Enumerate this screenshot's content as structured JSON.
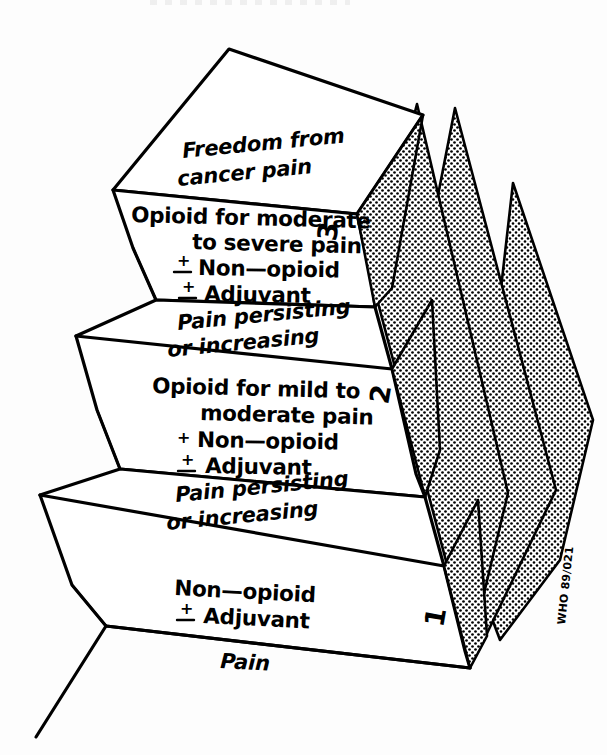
{
  "figure": {
    "credit": "WHO 89/021",
    "background_color": "#ffffff",
    "ink_color": "#000000"
  },
  "steps": [
    {
      "number": "1",
      "base_label": "Pain",
      "treatment_lines": [
        "Non—opioid",
        "Adjuvant"
      ],
      "treatment_signs": [
        "",
        "±"
      ],
      "outcome_lines": [
        "Pain persisting",
        "or increasing"
      ]
    },
    {
      "number": "2",
      "base_label": "Pain persisting or increasing",
      "treatment_lines": [
        "Opioid for mild to",
        "moderate pain",
        "Non—opioid",
        "Adjuvant"
      ],
      "treatment_signs": [
        "",
        "",
        "+",
        "±"
      ],
      "outcome_lines": [
        "Pain persisting",
        "or increasing"
      ]
    },
    {
      "number": "3",
      "base_label": "Pain persisting or increasing",
      "treatment_lines": [
        "Opioid for moderate",
        "to severe pain",
        "Non—opioid",
        "Adjuvant"
      ],
      "treatment_signs": [
        "",
        "",
        "±",
        "±"
      ],
      "outcome_lines": [
        "Freedom from",
        "cancer pain"
      ]
    }
  ],
  "labels": {
    "freedom_1": "Freedom from",
    "freedom_2": "cancer pain",
    "step3_tx_1": "Opioid for moderate",
    "step3_tx_2": "to severe pain",
    "step3_tx_3": "Non—opioid",
    "step3_tx_4": "Adjuvant",
    "persist_a_1": "Pain persisting",
    "persist_a_2": "or increasing",
    "step2_tx_1": "Opioid for mild to",
    "step2_tx_2": "moderate pain",
    "step2_tx_3": "Non—opioid",
    "step2_tx_4": "Adjuvant",
    "persist_b_1": "Pain persisting",
    "persist_b_2": "or increasing",
    "step1_tx_1": "Non—opioid",
    "step1_tx_2": "Adjuvant",
    "pain": "Pain",
    "num1": "1",
    "num2": "2",
    "num3": "3",
    "sign_plus": "+",
    "sign_plusminus": "±",
    "credit": "WHO 89/021"
  }
}
